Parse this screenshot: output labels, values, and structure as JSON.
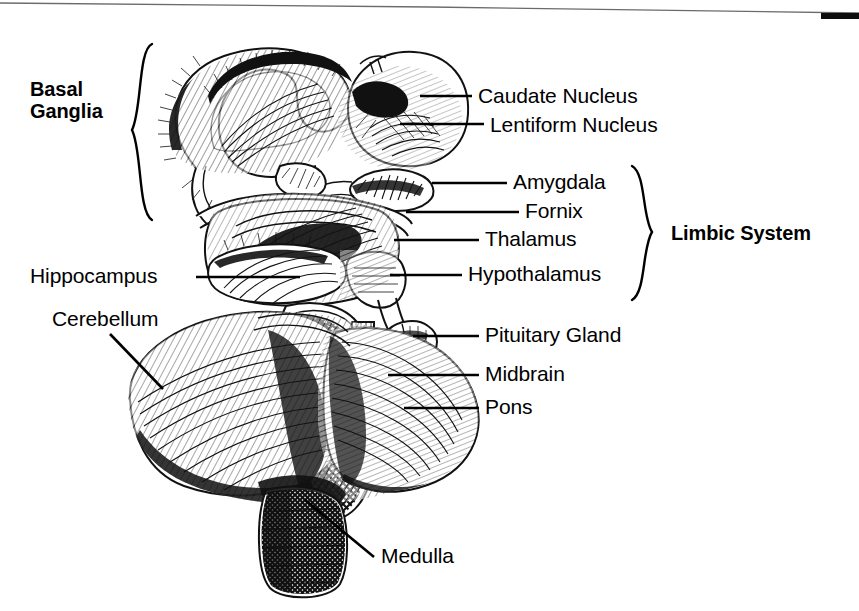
{
  "figure": {
    "background_color": "#ffffff",
    "ink_color": "#111111",
    "width": 859,
    "height": 611
  },
  "artifacts": {
    "top_scan_line": "scan-edge-line",
    "top_right_bar": "black-register-bar"
  },
  "group_labels": [
    {
      "id": "basal-ganglia",
      "line1": "Basal",
      "line2": "Ganglia",
      "bold": true,
      "x": 30,
      "y": 78,
      "brace_side": "right"
    },
    {
      "id": "limbic-system",
      "line1": "Limbic System",
      "line2": "",
      "bold": true,
      "x": 671,
      "y": 223,
      "brace_side": "left"
    }
  ],
  "callouts": [
    {
      "id": "caudate-nucleus",
      "text": "Caudate Nucleus",
      "x": 478,
      "y": 85,
      "leader": "M 420 96 L 472 96"
    },
    {
      "id": "lentiform-nucleus",
      "text": "Lentiform Nucleus",
      "x": 490,
      "y": 114,
      "leader": "M 400 124 L 484 124"
    },
    {
      "id": "amygdala",
      "text": "Amygdala",
      "x": 513,
      "y": 171,
      "leader": "M 432 183 L 507 183"
    },
    {
      "id": "fornix",
      "text": "Fornix",
      "x": 525,
      "y": 200,
      "leader": "M 406 212 L 519 212"
    },
    {
      "id": "thalamus",
      "text": "Thalamus",
      "x": 485,
      "y": 228,
      "leader": "M 394 240 L 479 240"
    },
    {
      "id": "hypothalamus",
      "text": "Hypothalamus",
      "x": 468,
      "y": 263,
      "leader": "M 390 275 L 462 275"
    },
    {
      "id": "hippocampus",
      "text": "Hippocampus",
      "x": 30,
      "y": 265,
      "leader": "M 196 277 L 300 277"
    },
    {
      "id": "cerebellum",
      "text": "Cerebellum",
      "x": 52,
      "y": 308,
      "leader": "M 110 334 L 163 389"
    },
    {
      "id": "pituitary-gland",
      "text": "Pituitary Gland",
      "x": 485,
      "y": 324,
      "leader": "M 413 336 L 479 336"
    },
    {
      "id": "midbrain",
      "text": "Midbrain",
      "x": 485,
      "y": 363,
      "leader": "M 388 375 L 479 375"
    },
    {
      "id": "pons",
      "text": "Pons",
      "x": 485,
      "y": 396,
      "leader": "M 404 408 L 479 408"
    },
    {
      "id": "medulla",
      "text": "Medulla",
      "x": 381,
      "y": 545,
      "leader": "M 305 500 L 374 557"
    }
  ]
}
